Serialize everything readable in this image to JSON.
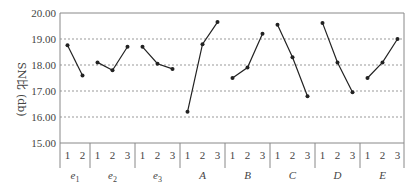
{
  "chart_data": {
    "type": "line",
    "title": "",
    "xlabel": "",
    "ylabel": "SN比(db)",
    "ylim": [
      15.0,
      20.0
    ],
    "yticks": [
      "15.00",
      "16.00",
      "17.00",
      "18.00",
      "19.00",
      "20.00"
    ],
    "grid": "horizontal dashed",
    "legend": null,
    "factors": [
      {
        "name": "e1",
        "label": "e",
        "sub": "1",
        "levels": [
          "1",
          "2"
        ],
        "values": [
          18.76,
          17.6
        ]
      },
      {
        "name": "e2",
        "label": "e",
        "sub": "2",
        "levels": [
          "1",
          "2",
          "3"
        ],
        "values": [
          18.1,
          17.8,
          18.7
        ]
      },
      {
        "name": "e3",
        "label": "e",
        "sub": "3",
        "levels": [
          "1",
          "2",
          "3"
        ],
        "values": [
          18.7,
          18.05,
          17.85
        ]
      },
      {
        "name": "A",
        "label": "A",
        "sub": "",
        "levels": [
          "1",
          "2",
          "3"
        ],
        "values": [
          16.2,
          18.8,
          19.65
        ]
      },
      {
        "name": "B",
        "label": "B",
        "sub": "",
        "levels": [
          "1",
          "2",
          "3"
        ],
        "values": [
          17.5,
          17.9,
          19.2
        ]
      },
      {
        "name": "C",
        "label": "C",
        "sub": "",
        "levels": [
          "1",
          "2",
          "3"
        ],
        "values": [
          19.55,
          18.3,
          16.8
        ]
      },
      {
        "name": "D",
        "label": "D",
        "sub": "",
        "levels": [
          "1",
          "2",
          "3"
        ],
        "values": [
          19.62,
          18.1,
          16.95
        ]
      },
      {
        "name": "E",
        "label": "E",
        "sub": "",
        "levels": [
          "1",
          "2",
          "3"
        ],
        "values": [
          17.5,
          18.1,
          19.0
        ]
      }
    ]
  },
  "axis": {
    "ylabel_main": "SN比",
    "ylabel_unit": "(db)"
  },
  "colors": {
    "line": "#222222",
    "grid": "#999999",
    "frame": "#888888"
  }
}
